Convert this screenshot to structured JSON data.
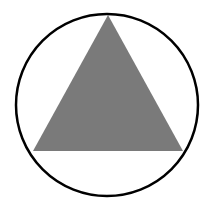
{
  "figure": {
    "width": 206,
    "height": 211,
    "background": "#ffffff",
    "circle": {
      "cx": 107,
      "cy": 105,
      "r": 91,
      "stroke": "#000000",
      "stroke_width": 2.5,
      "fill": "none"
    },
    "triangle": {
      "points": "108,15 33,151 183,151",
      "fill": "#7a7a7a"
    }
  }
}
